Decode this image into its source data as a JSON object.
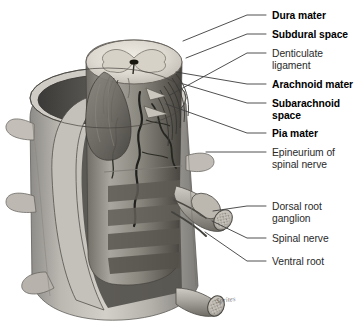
{
  "figure": {
    "signature": "Sprites",
    "background_color": "#ffffff",
    "ink_color": "#141414",
    "leader_color": "#3c3c3c"
  },
  "labels": [
    {
      "id": "dura-mater",
      "text": "Dura mater",
      "weight": "bold",
      "x": 272,
      "y": 10,
      "lines": [
        "Dura mater"
      ]
    },
    {
      "id": "subdural-space",
      "text": "Subdural space",
      "weight": "bold",
      "x": 272,
      "y": 29,
      "lines": [
        "Subdural space"
      ]
    },
    {
      "id": "denticulate-ligament",
      "text": "Denticulate ligament",
      "weight": "regular",
      "x": 272,
      "y": 48,
      "lines": [
        "Denticulate",
        "ligament"
      ]
    },
    {
      "id": "arachnoid-mater",
      "text": "Arachnoid mater",
      "weight": "bold",
      "x": 272,
      "y": 79,
      "lines": [
        "Arachnoid mater"
      ]
    },
    {
      "id": "subarachnoid-space",
      "text": "Subarachnoid space",
      "weight": "bold",
      "x": 272,
      "y": 98,
      "lines": [
        "Subarachnoid",
        "space"
      ]
    },
    {
      "id": "pia-mater",
      "text": "Pia mater",
      "weight": "bold",
      "x": 272,
      "y": 128,
      "lines": [
        "Pia mater"
      ]
    },
    {
      "id": "epineurium-of-spinal-nerve",
      "text": "Epineurium of spinal nerve",
      "weight": "regular",
      "x": 272,
      "y": 147,
      "lines": [
        "Epineurium of",
        "spinal nerve"
      ]
    },
    {
      "id": "dorsal-root-ganglion",
      "text": "Dorsal root ganglion",
      "weight": "regular",
      "x": 272,
      "y": 201,
      "lines": [
        "Dorsal root",
        "ganglion"
      ]
    },
    {
      "id": "spinal-nerve",
      "text": "Spinal nerve",
      "weight": "regular",
      "x": 272,
      "y": 233,
      "lines": [
        "Spinal nerve"
      ]
    },
    {
      "id": "ventral-root",
      "text": "Ventral root",
      "weight": "regular",
      "x": 272,
      "y": 256,
      "lines": [
        "Ventral root"
      ]
    }
  ],
  "leaders": [
    {
      "id": "leader-dura-mater",
      "path": "M 266 15  L 247 15  L 183 41"
    },
    {
      "id": "leader-subdural-space",
      "path": "M 266 34  L 247 34  L 186 58"
    },
    {
      "id": "leader-denticulate-ligament",
      "path": "M 266 53  L 247 53  L 170 95"
    },
    {
      "id": "leader-arachnoid-mater",
      "path": "M 266 84  L 247 84  L 176 72"
    },
    {
      "id": "leader-subarachnoid-space",
      "path": "M 266 103 L 247 103 L 180 83"
    },
    {
      "id": "leader-pia-mater",
      "path": "M 266 133 L 247 133 L 166 104"
    },
    {
      "id": "leader-epineurium",
      "path": "M 266 152 L 238 152 L 206 152"
    },
    {
      "id": "leader-dorsal-root-ganglion",
      "path": "M 266 206 L 247 206 L 213 211"
    },
    {
      "id": "leader-spinal-nerve",
      "path": "M 266 238 L 247 238 L 212 221"
    },
    {
      "id": "leader-ventral-root",
      "path": "M 266 261 L 247 261 L 205 232"
    }
  ],
  "anatomy": {
    "parts": [
      "dural sheath cylinder",
      "spinal cord cross section",
      "gray matter butterfly",
      "central canal",
      "arachnoid membrane flap",
      "denticulate ligament",
      "pia mater with blood vessels",
      "transverse processes",
      "dorsal root ganglion",
      "spinal nerve stump",
      "ventral root"
    ]
  }
}
